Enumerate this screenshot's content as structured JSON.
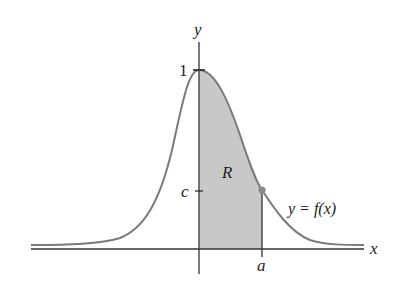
{
  "figure": {
    "axis_labels": {
      "x": "x",
      "y": "y"
    },
    "tick_labels": {
      "peak": "1",
      "c": "c",
      "a": "a"
    },
    "region_label": "R",
    "curve_label": "y = f(x)",
    "colors": {
      "curve": "#7a7a7a",
      "axis": "#333333",
      "region_fill": "#c8c8c8",
      "point": "#8a8a8a"
    }
  }
}
